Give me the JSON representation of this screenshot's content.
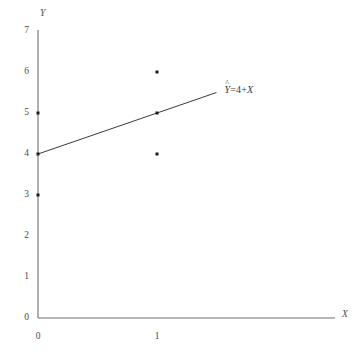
{
  "chart_data": {
    "type": "scatter",
    "title": "",
    "subtitle": "",
    "xlabel": "X",
    "ylabel": "Y",
    "xlim": [
      0,
      2.5
    ],
    "ylim": [
      0,
      7
    ],
    "grid": false,
    "legend_position": "none",
    "x_ticks": [
      "0",
      "1"
    ],
    "x_tick_values": [
      0,
      1
    ],
    "y_ticks": [
      "0",
      "1",
      "2",
      "3",
      "4",
      "5",
      "6",
      "7"
    ],
    "y_tick_values": [
      0,
      1,
      2,
      3,
      4,
      5,
      6,
      7
    ],
    "points": [
      {
        "x": 0,
        "y": 5
      },
      {
        "x": 0,
        "y": 4
      },
      {
        "x": 0,
        "y": 3
      },
      {
        "x": 1,
        "y": 6
      },
      {
        "x": 1,
        "y": 5
      },
      {
        "x": 1,
        "y": 4
      }
    ],
    "fit_line": {
      "intercept": 4,
      "slope": 1,
      "x_start": 0,
      "x_end": 1.5,
      "y_start": 4,
      "y_end": 5.5
    },
    "annotations": [
      {
        "name": "regression-equation",
        "hat_symbol": "^",
        "response_var": "Y",
        "equals": "=",
        "intercept": "4",
        "plus": "+",
        "predictor_var": "X",
        "full_text": "Ŷ = 4 + X",
        "x": 1.55,
        "y": 5.55
      }
    ],
    "colors": {
      "axis": "#6e6e6e",
      "fit_line": "#3a3a3a",
      "point": "#1a1a1a",
      "text": "#4a4a4a",
      "background": "#ffffff"
    }
  },
  "axes": {
    "y_axis_title": "Y",
    "x_axis_title": "X"
  }
}
